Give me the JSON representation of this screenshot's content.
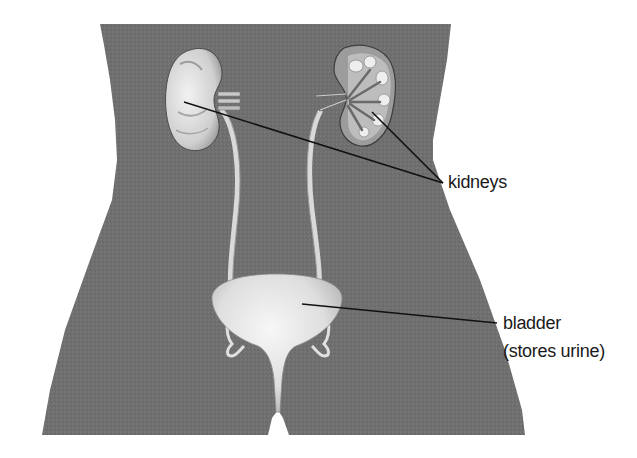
{
  "diagram": {
    "labels": {
      "kidneys": "kidneys",
      "bladder": "bladder",
      "bladder_note": "(stores urine)"
    },
    "parts": [
      "left kidney (exterior view)",
      "right kidney (cross-section)",
      "ureters",
      "bladder",
      "urethra"
    ],
    "colors": {
      "body": "#6f6f6f",
      "organ": "#e6e6e6",
      "organ_shadow": "#b9b9b9",
      "leader_line": "#111111",
      "background": "#ffffff"
    }
  }
}
